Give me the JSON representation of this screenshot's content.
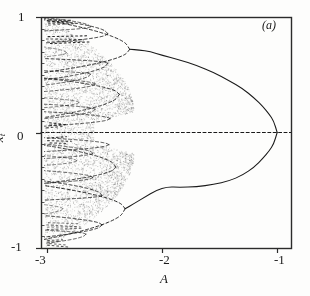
{
  "figure": {
    "panel_label": "(a)",
    "axes": {
      "x_label": "A",
      "y_label_base": "x",
      "y_label_sub": "t",
      "x_ticks": [
        "-3",
        "-2",
        "-1"
      ],
      "y_ticks": [
        "1",
        "0",
        "-1"
      ]
    },
    "colors": {
      "ink": "#1a1a1a",
      "frame": "#2b2b2b",
      "background": "#fdfdfc",
      "scatter": "#4a4a4a"
    }
  },
  "chart_data": {
    "type": "scatter",
    "title": "",
    "subtitle": "",
    "panel": "(a)",
    "xlabel": "A",
    "ylabel": "x_t",
    "xlim": [
      -3.05,
      -0.88
    ],
    "ylim": [
      -1.0,
      1.0
    ],
    "x_ticks": [
      -3,
      -2,
      -1
    ],
    "y_ticks": [
      -1,
      0,
      1
    ],
    "y_minor_ticks": [
      -0.9,
      -0.8,
      -0.7,
      -0.6,
      -0.5,
      -0.4,
      -0.3,
      -0.2,
      -0.1,
      0.1,
      0.2,
      0.3,
      0.4,
      0.5,
      0.6,
      0.7,
      0.8,
      0.9
    ],
    "grid": false,
    "legend": null,
    "series": [
      {
        "name": "zero-branch",
        "style": "dashed",
        "comment": "fixed point x=0, unstable/stable reference line at x_t = 0 drawn dashed across full width",
        "points": [
          [
            -3.05,
            0.0
          ],
          [
            -0.88,
            0.0
          ]
        ]
      },
      {
        "name": "upper-primary-branch",
        "style": "solid",
        "comment": "upper arm of pitchfork from A=-1 rising to ~0.72 at A=-2.2",
        "points": [
          [
            -1.0,
            0.0
          ],
          [
            -1.03,
            0.1
          ],
          [
            -1.07,
            0.16
          ],
          [
            -1.12,
            0.22
          ],
          [
            -1.2,
            0.3
          ],
          [
            -1.3,
            0.38
          ],
          [
            -1.42,
            0.45
          ],
          [
            -1.55,
            0.52
          ],
          [
            -1.7,
            0.58
          ],
          [
            -1.85,
            0.63
          ],
          [
            -2.0,
            0.67
          ],
          [
            -2.1,
            0.7
          ],
          [
            -2.2,
            0.715
          ],
          [
            -2.28,
            0.72
          ]
        ]
      },
      {
        "name": "lower-primary-branch",
        "style": "solid",
        "comment": "lower arm of pitchfork mirrored, terminating near -0.62 at A=-2.2",
        "points": [
          [
            -1.0,
            0.0
          ],
          [
            -1.03,
            -0.1
          ],
          [
            -1.07,
            -0.16
          ],
          [
            -1.12,
            -0.22
          ],
          [
            -1.2,
            -0.3
          ],
          [
            -1.3,
            -0.37
          ],
          [
            -1.42,
            -0.42
          ],
          [
            -1.55,
            -0.45
          ],
          [
            -1.7,
            -0.47
          ],
          [
            -1.85,
            -0.475
          ],
          [
            -1.95,
            -0.47
          ],
          [
            -2.05,
            -0.5
          ],
          [
            -2.15,
            -0.56
          ],
          [
            -2.25,
            -0.62
          ],
          [
            -2.32,
            -0.66
          ]
        ]
      },
      {
        "name": "period-2-upper",
        "style": "dashed",
        "comment": "first doubling of the upper branch, splitting near A=-2.25",
        "points": [
          [
            -2.28,
            0.72
          ],
          [
            -2.4,
            0.79
          ],
          [
            -2.55,
            0.85
          ],
          [
            -2.7,
            0.9
          ],
          [
            -2.85,
            0.94
          ],
          [
            -3.0,
            0.97
          ]
        ]
      },
      {
        "name": "period-2-upper-b",
        "style": "dashed",
        "points": [
          [
            -2.28,
            0.72
          ],
          [
            -2.4,
            0.63
          ],
          [
            -2.55,
            0.58
          ],
          [
            -2.7,
            0.55
          ],
          [
            -2.85,
            0.53
          ],
          [
            -3.0,
            0.52
          ]
        ]
      },
      {
        "name": "period-2-lower",
        "style": "dashed",
        "points": [
          [
            -2.32,
            -0.66
          ],
          [
            -2.45,
            -0.74
          ],
          [
            -2.6,
            -0.8
          ],
          [
            -2.78,
            -0.86
          ],
          [
            -2.92,
            -0.9
          ],
          [
            -3.0,
            -0.92
          ]
        ]
      },
      {
        "name": "period-2-lower-b",
        "style": "dashed",
        "points": [
          [
            -2.32,
            -0.66
          ],
          [
            -2.45,
            -0.58
          ],
          [
            -2.6,
            -0.53
          ],
          [
            -2.78,
            -0.49
          ],
          [
            -2.92,
            -0.47
          ],
          [
            -3.0,
            -0.46
          ]
        ]
      },
      {
        "name": "period-4-set",
        "style": "dashed",
        "comment": "nested loops/arcs of the second doubling visible between A=-2.4 and -3.0",
        "points": []
      },
      {
        "name": "chaotic-band",
        "style": "scatter",
        "comment": "dense speckled attractor filling |x_t| up to ~1 for A < -2.45",
        "x_range": [
          -3.02,
          -2.25
        ],
        "y_range": [
          -1.0,
          1.0
        ]
      }
    ]
  }
}
